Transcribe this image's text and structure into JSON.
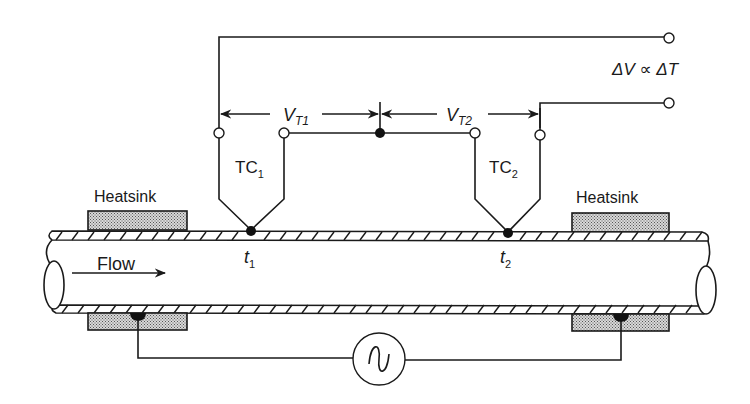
{
  "diagram": {
    "labels": {
      "output_relation": "ΔV ∝ ΔT",
      "vt1_main": "V",
      "vt1_sub": "T1",
      "vt2_main": "V",
      "vt2_sub": "T2",
      "tc1_main": "TC",
      "tc1_sub": "1",
      "tc2_main": "TC",
      "tc2_sub": "2",
      "t1_main": "t",
      "t1_sub": "1",
      "t2_main": "t",
      "t2_sub": "2",
      "heatsink_left": "Heatsink",
      "heatsink_right": "Heatsink",
      "flow": "Flow"
    },
    "components": [
      {
        "id": "TC1",
        "type": "thermocouple",
        "junction": "t1"
      },
      {
        "id": "TC2",
        "type": "thermocouple",
        "junction": "t2"
      },
      {
        "id": "heatsink-upper-left",
        "type": "heatsink"
      },
      {
        "id": "heatsink-lower-left",
        "type": "heatsink"
      },
      {
        "id": "heatsink-upper-right",
        "type": "heatsink"
      },
      {
        "id": "heatsink-lower-right",
        "type": "heatsink"
      },
      {
        "id": "ac-source",
        "type": "ac-voltage-source",
        "symbol": "~"
      },
      {
        "id": "pipe",
        "type": "pipe",
        "flow_direction": "left-to-right"
      },
      {
        "id": "output-terminals",
        "type": "terminal-pair",
        "relation": "ΔV ∝ ΔT"
      }
    ],
    "colors": {
      "line": "#1a1a1a",
      "background": "#ffffff",
      "heatsink_fill": "#bdbdbd"
    }
  }
}
